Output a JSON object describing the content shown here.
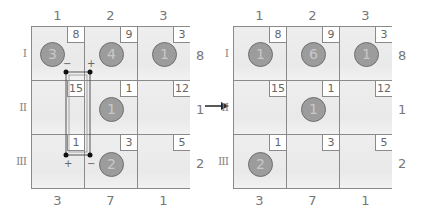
{
  "diagram": {
    "type": "grid-puzzle-transformation",
    "arrow": "right-arrow",
    "colors": {
      "cell_bg": "#ededed",
      "grid_line": "#8a8a8a",
      "disc_fill": "#9c9c9c",
      "disc_outline": "#6f6f6f",
      "text": "#777777"
    }
  },
  "before": {
    "column_labels": [
      "1",
      "2",
      "3"
    ],
    "row_labels": [
      "I",
      "II",
      "III"
    ],
    "bottom_labels": [
      "3",
      "7",
      "1"
    ],
    "right_labels": [
      "8",
      "1",
      "2"
    ],
    "cells": [
      [
        {
          "clue": "8",
          "disc": "3"
        },
        {
          "clue": "9",
          "disc": "4"
        },
        {
          "clue": "3",
          "disc": "1"
        }
      ],
      [
        {
          "clue": "15",
          "disc": null
        },
        {
          "clue": "1",
          "disc": "1"
        },
        {
          "clue": "12",
          "disc": null
        }
      ],
      [
        {
          "clue": "1",
          "disc": null
        },
        {
          "clue": "3",
          "disc": "2"
        },
        {
          "clue": "5",
          "disc": null
        }
      ]
    ],
    "loop": {
      "signs": {
        "top_left": "−",
        "top_right": "+",
        "bottom_left": "+",
        "bottom_right": "−"
      }
    }
  },
  "after": {
    "column_labels": [
      "1",
      "2",
      "3"
    ],
    "row_labels": [
      "I",
      "II",
      "III"
    ],
    "bottom_labels": [
      "3",
      "7",
      "1"
    ],
    "right_labels": [
      "8",
      "1",
      "2"
    ],
    "cells": [
      [
        {
          "clue": "8",
          "disc": "1"
        },
        {
          "clue": "9",
          "disc": "6"
        },
        {
          "clue": "3",
          "disc": "1"
        }
      ],
      [
        {
          "clue": "15",
          "disc": null
        },
        {
          "clue": "1",
          "disc": "1"
        },
        {
          "clue": "12",
          "disc": null
        }
      ],
      [
        {
          "clue": "1",
          "disc": "2"
        },
        {
          "clue": "3",
          "disc": null
        },
        {
          "clue": "5",
          "disc": null
        }
      ]
    ]
  }
}
